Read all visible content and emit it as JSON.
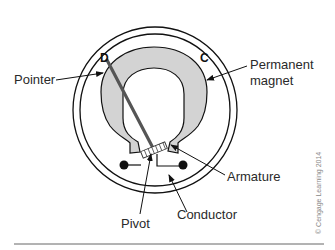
{
  "figure": {
    "letters": {
      "left": "D",
      "right": "C"
    },
    "labels": {
      "pointer": "Pointer",
      "permanent_magnet_line1": "Permanent",
      "permanent_magnet_line2": "magnet",
      "armature": "Armature",
      "conductor": "Conductor",
      "pivot": "Pivot"
    },
    "copyright": "© Cengage Learning 2014",
    "colors": {
      "magnet_fill": "#d3d3d3",
      "stroke": "#111111",
      "pointer": "#555555",
      "text": "#2a2a2a"
    }
  }
}
